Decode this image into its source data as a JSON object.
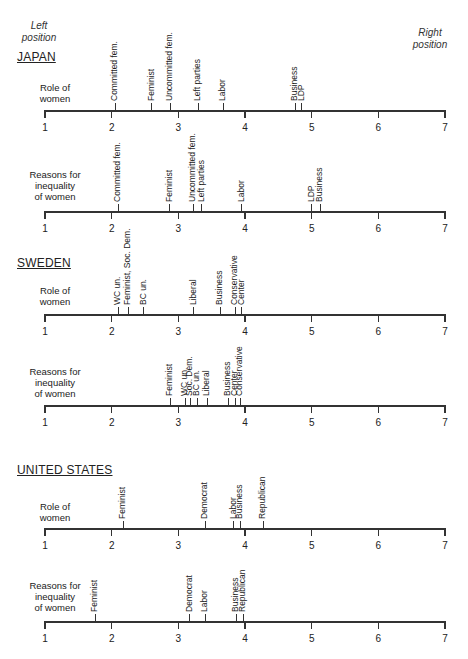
{
  "corner_labels": {
    "left": [
      "Left",
      "position"
    ],
    "right": [
      "Right",
      "position"
    ]
  },
  "axis": {
    "min": 1,
    "max": 7,
    "ticks": [
      1,
      2,
      3,
      4,
      5,
      6,
      7
    ]
  },
  "chart_data": [
    {
      "type": "scatter",
      "title": "JAPAN — Role of women",
      "country": "JAPAN",
      "row": "Role of women",
      "xlim": [
        1,
        7
      ],
      "xlabel": "Left position → Right position",
      "points": [
        {
          "label": "Committed fem.",
          "x": 2.05
        },
        {
          "label": "Feminist",
          "x": 2.6
        },
        {
          "label": "Uncommitted fem.",
          "x": 2.88
        },
        {
          "label": "Left parties",
          "x": 3.3
        },
        {
          "label": "Labor",
          "x": 3.67
        },
        {
          "label": "Business",
          "x": 4.75
        },
        {
          "label": "LDP",
          "x": 4.85
        }
      ]
    },
    {
      "type": "scatter",
      "title": "JAPAN — Reasons for inequality of women",
      "country": "JAPAN",
      "row": "Reasons for inequality of women",
      "xlim": [
        1,
        7
      ],
      "points": [
        {
          "label": "Committed fem.",
          "x": 2.1
        },
        {
          "label": "Feminist",
          "x": 2.87
        },
        {
          "label": "Uncommitted fem.",
          "x": 3.22
        },
        {
          "label": "Left parties",
          "x": 3.35
        },
        {
          "label": "Labor",
          "x": 3.95
        },
        {
          "label": "LDP",
          "x": 5.0
        },
        {
          "label": "Business",
          "x": 5.13
        }
      ]
    },
    {
      "type": "scatter",
      "title": "SWEDEN — Role of women",
      "country": "SWEDEN",
      "row": "Role of women",
      "xlim": [
        1,
        7
      ],
      "points": [
        {
          "label": "WC un.",
          "x": 2.1
        },
        {
          "label": "Feminist, Soc. Dem.",
          "x": 2.25
        },
        {
          "label": "BC un.",
          "x": 2.48
        },
        {
          "label": "Liberal",
          "x": 3.23
        },
        {
          "label": "Business",
          "x": 3.63
        },
        {
          "label": "Conservative",
          "x": 3.85
        },
        {
          "label": "Center",
          "x": 3.95
        }
      ]
    },
    {
      "type": "scatter",
      "title": "SWEDEN — Reasons for inequality of women",
      "country": "SWEDEN",
      "row": "Reasons for inequality of women",
      "xlim": [
        1,
        7
      ],
      "points": [
        {
          "label": "Feminist",
          "x": 2.88
        },
        {
          "label": "WC un.",
          "x": 3.1
        },
        {
          "label": "Soc. Dem.",
          "x": 3.18
        },
        {
          "label": "BC un.",
          "x": 3.28
        },
        {
          "label": "Liberal",
          "x": 3.43
        },
        {
          "label": "Business",
          "x": 3.75
        },
        {
          "label": "Center",
          "x": 3.85
        },
        {
          "label": "Conservative",
          "x": 3.93
        }
      ]
    },
    {
      "type": "scatter",
      "title": "UNITED STATES — Role of women",
      "country": "UNITED STATES",
      "row": "Role of women",
      "xlim": [
        1,
        7
      ],
      "points": [
        {
          "label": "Feminist",
          "x": 2.17
        },
        {
          "label": "Democrat",
          "x": 3.4
        },
        {
          "label": "Labor",
          "x": 3.83
        },
        {
          "label": "Business",
          "x": 3.93
        },
        {
          "label": "Republican",
          "x": 4.27
        }
      ]
    },
    {
      "type": "scatter",
      "title": "UNITED STATES — Reasons for inequality of women",
      "country": "UNITED STATES",
      "row": "Reasons for inequality of women",
      "xlim": [
        1,
        7
      ],
      "points": [
        {
          "label": "Feminist",
          "x": 1.75
        },
        {
          "label": "Democrat",
          "x": 3.17
        },
        {
          "label": "Labor",
          "x": 3.4
        },
        {
          "label": "Business",
          "x": 3.87
        },
        {
          "label": "Republican",
          "x": 3.97
        }
      ]
    }
  ],
  "sections": [
    {
      "country": "JAPAN",
      "country_y": 50,
      "rows": [
        {
          "label": [
            "Role of",
            "women"
          ],
          "label_y": 82,
          "axis_y": 110,
          "chart_index": 0
        },
        {
          "label": [
            "Reasons for",
            "inequality",
            "of women"
          ],
          "label_y": 169,
          "axis_y": 211,
          "chart_index": 1
        }
      ]
    },
    {
      "country": "SWEDEN",
      "country_y": 256,
      "rows": [
        {
          "label": [
            "Role of",
            "women"
          ],
          "label_y": 285,
          "axis_y": 314,
          "chart_index": 2
        },
        {
          "label": [
            "Reasons for",
            "inequality",
            "of women"
          ],
          "label_y": 366,
          "axis_y": 405,
          "chart_index": 3
        }
      ]
    },
    {
      "country": "UNITED STATES",
      "country_y": 463,
      "rows": [
        {
          "label": [
            "Role of",
            "women"
          ],
          "label_y": 501,
          "axis_y": 528,
          "chart_index": 4
        },
        {
          "label": [
            "Reasons for",
            "inequality",
            "of women"
          ],
          "label_y": 580,
          "axis_y": 621,
          "chart_index": 5
        }
      ]
    }
  ]
}
